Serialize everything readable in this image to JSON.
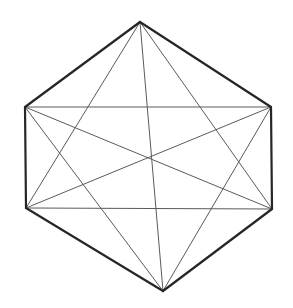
{
  "figure": {
    "type": "line-drawing",
    "canvas": {
      "width": 293,
      "height": 308,
      "background": "#ffffff"
    },
    "style": {
      "hull_stroke_color": "#262626",
      "hull_stroke_width": 2.2,
      "inner_stroke_color": "#5a5a5a",
      "inner_stroke_width": 1.0
    },
    "vertices": [
      {
        "id": "top-apex",
        "label": "A",
        "x": 140,
        "y": 22
      },
      {
        "id": "upper-left",
        "label": "B",
        "x": 25,
        "y": 107
      },
      {
        "id": "upper-right",
        "label": "C",
        "x": 271,
        "y": 107
      },
      {
        "id": "lower-left",
        "label": "D",
        "x": 26,
        "y": 208
      },
      {
        "id": "lower-right",
        "label": "E",
        "x": 272,
        "y": 209
      },
      {
        "id": "bottom-apex",
        "label": "F",
        "x": 163,
        "y": 291
      }
    ],
    "hull_edges": [
      {
        "id": "edge-top-left",
        "from": "top-apex",
        "to": "upper-left"
      },
      {
        "id": "edge-top-right",
        "from": "top-apex",
        "to": "upper-right"
      },
      {
        "id": "edge-left-side",
        "from": "upper-left",
        "to": "lower-left"
      },
      {
        "id": "edge-right-side",
        "from": "upper-right",
        "to": "lower-right"
      },
      {
        "id": "edge-bottom-left",
        "from": "lower-left",
        "to": "bottom-apex"
      },
      {
        "id": "edge-bottom-right",
        "from": "lower-right",
        "to": "bottom-apex"
      }
    ],
    "inner_edges": [
      {
        "id": "inner-top-horizontal",
        "from": "upper-left",
        "to": "upper-right"
      },
      {
        "id": "inner-bottom-horizontal",
        "from": "lower-left",
        "to": "lower-right"
      },
      {
        "id": "inner-diag-ul-lr",
        "from": "upper-left",
        "to": "lower-right"
      },
      {
        "id": "inner-diag-ur-ll",
        "from": "upper-right",
        "to": "lower-left"
      },
      {
        "id": "inner-apex-ll",
        "from": "top-apex",
        "to": "lower-left"
      },
      {
        "id": "inner-apex-lr",
        "from": "top-apex",
        "to": "lower-right"
      },
      {
        "id": "inner-apex-bottom",
        "from": "top-apex",
        "to": "bottom-apex"
      },
      {
        "id": "inner-bottom-ul",
        "from": "bottom-apex",
        "to": "upper-left"
      },
      {
        "id": "inner-bottom-ur",
        "from": "bottom-apex",
        "to": "upper-right"
      }
    ],
    "intersections": [
      {
        "id": "center-crossing",
        "x": 152,
        "y": 157
      }
    ]
  }
}
